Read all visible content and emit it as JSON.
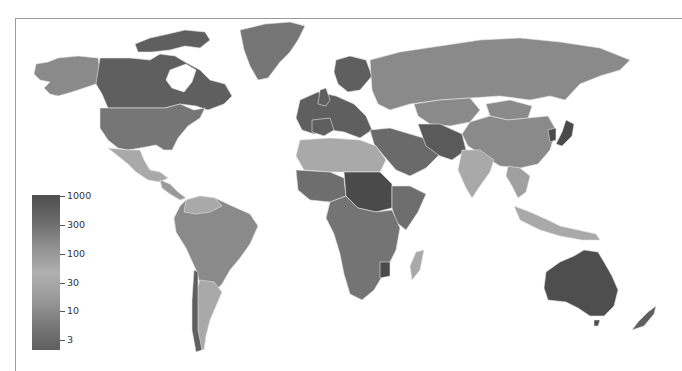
{
  "map": {
    "title": "",
    "type": "choropleth world map (grayscale)",
    "colors": {
      "background": "#ffffff",
      "frame": "#9a9a9a",
      "border": "#e4e4e4",
      "very_high": "#4a4a4a",
      "high": "#5f5f5f",
      "mid_high": "#767676",
      "mid": "#8a8a8a",
      "light": "#a9a9a9"
    }
  },
  "legend": {
    "scale": "logarithmic",
    "gradient": [
      "#4e4e4e",
      "#6a6a6a",
      "#909090",
      "#b0b0b0",
      "#9a9a9a",
      "#7a7a7a",
      "#5e5e5e"
    ],
    "ticks": [
      {
        "label": "1000",
        "y": 1
      },
      {
        "label": "300",
        "y": 30
      },
      {
        "label": "100",
        "y": 59
      },
      {
        "label": "30",
        "y": 88
      },
      {
        "label": "10",
        "y": 116
      },
      {
        "label": "3",
        "y": 145
      }
    ]
  },
  "regions": [
    {
      "name": "Alaska",
      "shade": "mid"
    },
    {
      "name": "Canada",
      "shade": "high"
    },
    {
      "name": "United States",
      "shade": "mid_high"
    },
    {
      "name": "Greenland",
      "shade": "mid_high"
    },
    {
      "name": "Mexico",
      "shade": "light"
    },
    {
      "name": "South America",
      "shade": "mid"
    },
    {
      "name": "Argentina",
      "shade": "light"
    },
    {
      "name": "Europe",
      "shade": "high"
    },
    {
      "name": "Russia",
      "shade": "mid"
    },
    {
      "name": "North Africa",
      "shade": "light"
    },
    {
      "name": "Sub-Saharan Africa",
      "shade": "mid_high"
    },
    {
      "name": "Sudan",
      "shade": "very_high"
    },
    {
      "name": "Middle East",
      "shade": "high"
    },
    {
      "name": "India",
      "shade": "light"
    },
    {
      "name": "China",
      "shade": "mid"
    },
    {
      "name": "Southeast Asia",
      "shade": "light"
    },
    {
      "name": "Japan",
      "shade": "very_high"
    },
    {
      "name": "Australia",
      "shade": "very_high"
    },
    {
      "name": "New Zealand",
      "shade": "high"
    },
    {
      "name": "Madagascar",
      "shade": "light"
    }
  ]
}
